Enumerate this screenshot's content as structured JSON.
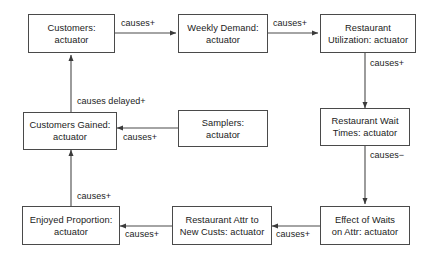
{
  "diagram": {
    "background_color": "#ffffff",
    "stroke_color": "#4a4a4a",
    "text_color": "#1b1b1b",
    "nodes": [
      {
        "id": "customers",
        "label": "Customers:\nactuator"
      },
      {
        "id": "weekly_demand",
        "label": "Weekly Demand:\nactuator"
      },
      {
        "id": "restaurant_util",
        "label": "Restaurant\nUtilization: actuator"
      },
      {
        "id": "customers_gained",
        "label": "Customers Gained:\nactuator"
      },
      {
        "id": "samplers",
        "label": "Samplers:\nactuator"
      },
      {
        "id": "wait_times",
        "label": "Restaurant Wait\nTimes: actuator"
      },
      {
        "id": "enjoyed_prop",
        "label": "Enjoyed Proportion:\nactuator"
      },
      {
        "id": "restaurant_attr",
        "label": "Restaurant Attr to\nNew Custs: actuator"
      },
      {
        "id": "effect_of_waits",
        "label": "Effect of Waits\non Attr: actuator"
      }
    ],
    "edges": [
      {
        "id": "e1",
        "from": "customers",
        "to": "weekly_demand",
        "label": "causes+"
      },
      {
        "id": "e2",
        "from": "weekly_demand",
        "to": "restaurant_util",
        "label": "causes+"
      },
      {
        "id": "e3",
        "from": "restaurant_util",
        "to": "wait_times",
        "label": "causes+"
      },
      {
        "id": "e4",
        "from": "wait_times",
        "to": "effect_of_waits",
        "label": "causes−"
      },
      {
        "id": "e5",
        "from": "effect_of_waits",
        "to": "restaurant_attr",
        "label": "causes+"
      },
      {
        "id": "e6",
        "from": "restaurant_attr",
        "to": "enjoyed_prop",
        "label": "causes+"
      },
      {
        "id": "e7",
        "from": "enjoyed_prop",
        "to": "customers_gained",
        "label": "causes+"
      },
      {
        "id": "e8",
        "from": "samplers",
        "to": "customers_gained",
        "label": "causes+"
      },
      {
        "id": "e9",
        "from": "customers_gained",
        "to": "customers",
        "label": "causes delayed+"
      }
    ]
  }
}
